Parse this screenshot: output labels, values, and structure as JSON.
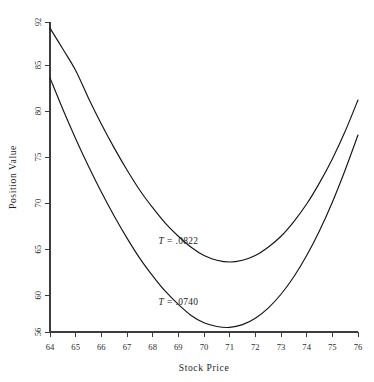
{
  "chart_data": {
    "type": "line",
    "title": "",
    "xlabel": "Stock Price",
    "ylabel": "Position Value",
    "xlim": [
      64,
      76
    ],
    "ylim": [
      56,
      92
    ],
    "grid": false,
    "legend_position": "inline-annotation",
    "xticks": [
      "64",
      "65",
      "66",
      "67",
      "68",
      "69",
      "70",
      "71",
      "72",
      "73",
      "74",
      "75",
      "76"
    ],
    "xtick_values": [
      64,
      65,
      66,
      67,
      68,
      69,
      70,
      71,
      72,
      73,
      74,
      75,
      76
    ],
    "yticks": [
      "56",
      "60",
      "65",
      "70",
      "75",
      "80",
      "85",
      "92"
    ],
    "ytick_values": [
      56,
      60,
      65,
      70,
      75,
      80,
      85,
      92
    ],
    "x": [
      64,
      64.5,
      65,
      65.5,
      66,
      66.5,
      67,
      67.5,
      68,
      68.5,
      69,
      69.5,
      70,
      70.5,
      71,
      71.5,
      72,
      72.5,
      73,
      73.5,
      74,
      74.5,
      75,
      75.5,
      76
    ],
    "series": [
      {
        "name": "T = .0822",
        "label_text_prefix": "T",
        "label_text_eq": "=",
        "label_text_value": ".0822",
        "label_x": 69.0,
        "label_y": 65.6,
        "color": "#151515",
        "values": [
          91.0,
          87.6,
          84.4,
          81.4,
          78.6,
          76.0,
          73.6,
          71.4,
          69.5,
          67.8,
          66.4,
          65.2,
          64.3,
          63.8,
          63.6,
          63.8,
          64.3,
          65.2,
          66.4,
          68.0,
          69.9,
          72.2,
          74.8,
          77.8,
          81.2
        ]
      },
      {
        "name": "T = .0740",
        "label_text_prefix": "T",
        "label_text_eq": "=",
        "label_text_value": ".0740",
        "label_x": 69.0,
        "label_y": 58.9,
        "color": "#151515",
        "values": [
          83.6,
          80.2,
          77.0,
          74.0,
          71.2,
          68.6,
          66.2,
          64.0,
          62.1,
          60.4,
          59.0,
          57.8,
          57.0,
          56.6,
          56.5,
          56.8,
          57.5,
          58.6,
          60.1,
          62.0,
          64.3,
          67.0,
          70.1,
          73.6,
          77.4
        ]
      }
    ],
    "annotations": [
      {
        "text": "T = .0822",
        "x": 69.0,
        "y": 65.6
      },
      {
        "text": "T = .0740",
        "x": 69.0,
        "y": 58.9
      }
    ]
  }
}
